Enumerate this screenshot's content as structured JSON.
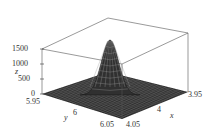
{
  "chart_data": {
    "type": "surface3d",
    "title": "",
    "xlabel": "x",
    "ylabel": "y",
    "zlabel": "z",
    "x_ticks": [
      "3.95",
      "4",
      "4.05"
    ],
    "y_ticks": [
      "5.95",
      "6",
      "6.05"
    ],
    "z_ticks": [
      "0",
      "500",
      "1000",
      "1500"
    ],
    "xlim": [
      3.95,
      4.05
    ],
    "ylim": [
      5.95,
      6.05
    ],
    "zlim": [
      0,
      1500
    ],
    "peak": {
      "x": 4,
      "y": 6,
      "z": 1500
    },
    "surface_color": "#2a2a2a",
    "mesh_color": "#9a9a9a",
    "box": true
  }
}
